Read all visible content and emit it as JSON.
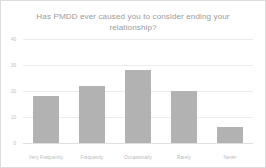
{
  "chart_data": {
    "type": "bar",
    "title": "Has PMDD ever caused you to consider ending your relationship?",
    "categories": [
      "Very Frequently",
      "Frequently",
      "Occasionally",
      "Rarely",
      "Never"
    ],
    "values": [
      18,
      22,
      28,
      20,
      6
    ],
    "xlabel": "",
    "ylabel": "",
    "ylim": [
      0,
      40
    ],
    "yticks": [
      "0",
      "10",
      "20",
      "30",
      "40"
    ],
    "ytick_values": [
      0,
      10,
      20,
      30,
      40
    ],
    "grid": true,
    "legend": false,
    "bar_color": "#b2b2b2",
    "grid_color": "#eceaea",
    "text_color": "#9a9a9a"
  }
}
